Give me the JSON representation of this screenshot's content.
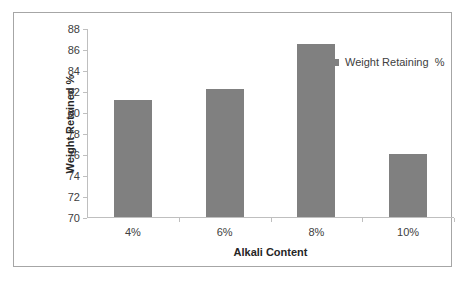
{
  "chart_data": {
    "type": "bar",
    "title": "",
    "categories": [
      "4%",
      "6%",
      "8%",
      "10%"
    ],
    "values": [
      81.1,
      82.2,
      86.5,
      76.0
    ],
    "series": [
      {
        "name": "Weight Retaining  %",
        "values": [
          81.1,
          82.2,
          86.5,
          76.0
        ],
        "color": "#808080"
      }
    ],
    "xlabel": "Alkali Content",
    "ylabel": "Weight Retained %",
    "ylim": [
      70,
      88
    ],
    "ytick_step": 2,
    "yticks": [
      70,
      72,
      74,
      76,
      78,
      80,
      82,
      84,
      86,
      88
    ],
    "ytick_labels": [
      "70",
      "72",
      "74",
      "76",
      "78",
      "80",
      "82",
      "84",
      "86",
      "88"
    ],
    "grid": false,
    "legend": {
      "entries": [
        "Weight Retaining  %"
      ],
      "position": "right-top",
      "marker": "square-swatch"
    },
    "axis_color": "#bfbfbf",
    "border_color": "#a6a6a6",
    "background": "#ffffff"
  }
}
